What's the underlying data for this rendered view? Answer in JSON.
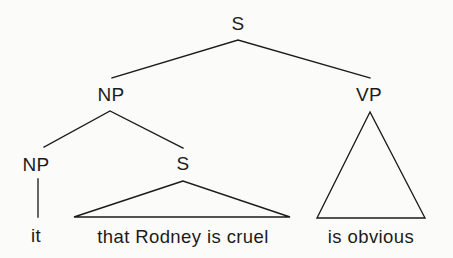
{
  "diagram": {
    "kind": "syntax-tree",
    "sentence": "it that Rodney is cruel is obvious",
    "colors": {
      "background": "#fbfbfa",
      "line": "#1b1b1b",
      "text": "#1b1b1b"
    },
    "nodes": {
      "root_s": "S",
      "subject_np": "NP",
      "predicate_vp": "VP",
      "expletive_np": "NP",
      "embedded_s": "S"
    },
    "terminals": {
      "expletive": "it",
      "clause": "that Rodney is cruel",
      "predicate": "is obvious"
    }
  },
  "geometry": {
    "root_s_label": {
      "x": 238,
      "y": 30
    },
    "root_apex": {
      "x": 238,
      "y": 40
    },
    "root_left_end": {
      "x": 112,
      "y": 78
    },
    "root_right_end": {
      "x": 370,
      "y": 78
    },
    "subject_np_label": {
      "x": 111,
      "y": 101
    },
    "predicate_vp_label": {
      "x": 369,
      "y": 101
    },
    "np_apex": {
      "x": 110,
      "y": 111
    },
    "np_left_end": {
      "x": 44,
      "y": 147
    },
    "np_right_end": {
      "x": 183,
      "y": 148
    },
    "expletive_np_label": {
      "x": 36,
      "y": 171
    },
    "embedded_s_label": {
      "x": 183,
      "y": 170
    },
    "stem_top": {
      "x": 38,
      "y": 179
    },
    "stem_bottom": {
      "x": 38,
      "y": 217
    },
    "s_triangle_apex": {
      "x": 183,
      "y": 181
    },
    "s_triangle_left": {
      "x": 74,
      "y": 217
    },
    "s_triangle_right": {
      "x": 290,
      "y": 217
    },
    "vp_triangle_apex": {
      "x": 370,
      "y": 112
    },
    "vp_triangle_left": {
      "x": 317,
      "y": 218
    },
    "vp_triangle_right": {
      "x": 425,
      "y": 218
    },
    "expletive_text": {
      "x": 36,
      "y": 242
    },
    "clause_text": {
      "x": 183,
      "y": 243
    },
    "predicate_text": {
      "x": 371,
      "y": 243
    }
  }
}
